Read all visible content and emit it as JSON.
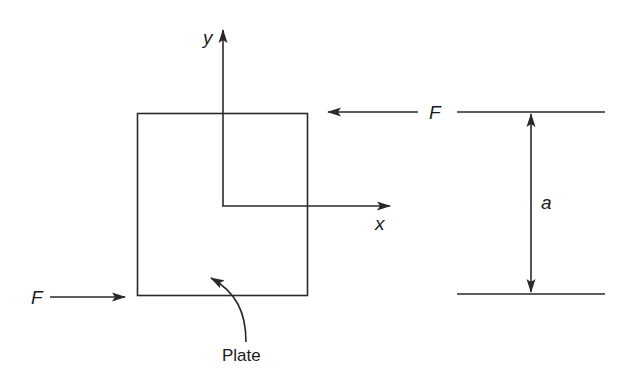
{
  "diagram": {
    "type": "free-body diagram",
    "stroke_color": "#2a2a2a",
    "labels": {
      "y_axis": "y",
      "x_axis": "x",
      "force_top": "F",
      "force_left": "F",
      "dimension": "a",
      "plate": "Plate"
    },
    "elements": [
      {
        "name": "plate",
        "shape": "rectangle"
      },
      {
        "name": "y-axis",
        "direction": "up"
      },
      {
        "name": "x-axis",
        "direction": "right"
      },
      {
        "name": "force-top",
        "direction": "left",
        "label": "F"
      },
      {
        "name": "force-left",
        "direction": "right",
        "label": "F"
      },
      {
        "name": "dimension-a",
        "between": [
          "top-reference-line",
          "bottom-reference-line"
        ],
        "label": "a"
      },
      {
        "name": "plate-pointer",
        "shape": "curved-arrow",
        "label": "Plate"
      }
    ]
  }
}
